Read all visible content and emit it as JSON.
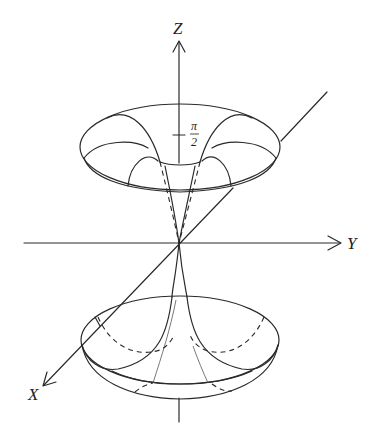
{
  "figure": {
    "axes": {
      "z_label": "Z",
      "y_label": "Y",
      "x_label": "X"
    },
    "annotations": {
      "tick_label_numerator": "π",
      "tick_label_denominator": "2",
      "tick_meaning": "π/2 marked on Z axis"
    },
    "colors": {
      "line": "#2a2a2a",
      "background": "#ffffff"
    }
  }
}
